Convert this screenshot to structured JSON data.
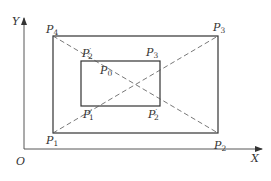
{
  "diagram": {
    "type": "geometry",
    "axes": {
      "x_label": "X",
      "y_label": "Y",
      "origin_label": "O"
    },
    "outer_rectangle": {
      "corners": [
        {
          "id": "P1",
          "label": "P",
          "sub": "1",
          "prime": "",
          "position": "bottom-left"
        },
        {
          "id": "P2",
          "label": "P",
          "sub": "2",
          "prime": "",
          "position": "bottom-right"
        },
        {
          "id": "P3",
          "label": "P",
          "sub": "3",
          "prime": "",
          "position": "top-right"
        },
        {
          "id": "P4",
          "label": "P",
          "sub": "4",
          "prime": "",
          "position": "top-left"
        }
      ]
    },
    "inner_rectangle": {
      "corners": [
        {
          "id": "P1'",
          "label": "P",
          "sub": "1",
          "prime": "′",
          "position": "bottom-left"
        },
        {
          "id": "P2'",
          "label": "P",
          "sub": "2",
          "prime": "′",
          "position": "bottom-right"
        },
        {
          "id": "P3",
          "label": "P",
          "sub": "3",
          "prime": "",
          "position": "top-right"
        },
        {
          "id": "P2'_top",
          "label": "P",
          "sub": "2",
          "prime": "′",
          "position": "top-left"
        }
      ]
    },
    "center": {
      "id": "P0",
      "label": "P",
      "sub": "0"
    },
    "diagonals": [
      {
        "from": "P1",
        "to": "P3",
        "style": "dashed"
      },
      {
        "from": "P4",
        "to": "P2",
        "style": "dashed"
      }
    ],
    "colors": {
      "stroke": "#333333",
      "dash": "#555555",
      "background": "#ffffff"
    }
  }
}
